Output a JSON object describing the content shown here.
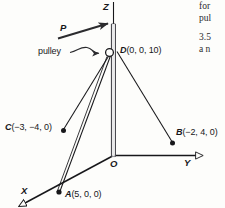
{
  "figure": {
    "name": "pole-and-cables-3d-diagram",
    "background_color": "#fdfdfb",
    "ink_color": "#17171a",
    "axes": {
      "z_label": "Z",
      "y_label": "Y",
      "x_label": "X",
      "origin_label": "O"
    },
    "points": [
      {
        "key": "D",
        "label": "D(0, 0, 10)",
        "italic_part": "D",
        "rest": "(0, 0, 10)"
      },
      {
        "key": "C",
        "label": "C(−3, −4, 0)",
        "italic_part": "C",
        "rest": "(−3, −4, 0)"
      },
      {
        "key": "B",
        "label": "B(−2, 4, 0)",
        "italic_part": "B",
        "rest": "(−2, 4, 0)"
      },
      {
        "key": "A",
        "label": "A(5, 0, 0)",
        "italic_part": "A",
        "rest": "(5, 0, 0)"
      }
    ],
    "annotations": {
      "force_label": "P",
      "pulley_label": "pulley"
    }
  },
  "bleed_text": {
    "lines": [
      "for",
      "pul",
      "3.5",
      "a n"
    ]
  }
}
